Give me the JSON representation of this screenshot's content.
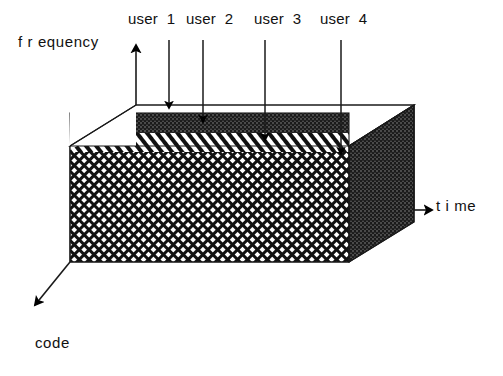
{
  "figure": {
    "background_color": "#ffffff",
    "stroke_color": "#000000"
  },
  "axes": [
    {
      "id": "frequency",
      "label": "f r equency",
      "direction": "up",
      "label_x": 18,
      "label_y": 33
    },
    {
      "id": "time",
      "label": "t i me",
      "direction": "right",
      "label_x": 436,
      "label_y": 197
    },
    {
      "id": "code",
      "label": "code",
      "direction": "down-left",
      "label_x": 35,
      "label_y": 334
    }
  ],
  "callouts": [
    {
      "id": "user-1",
      "label": "user  1",
      "label_x": 128,
      "label_y": 10,
      "arrow_x": 169,
      "arrow_top": 40,
      "arrow_bottom": 108
    },
    {
      "id": "user-2",
      "label": "user  2",
      "label_x": 186,
      "label_y": 10,
      "arrow_x": 203,
      "arrow_top": 40,
      "arrow_bottom": 122
    },
    {
      "id": "user-3",
      "label": "user  3",
      "label_x": 254,
      "label_y": 10,
      "arrow_x": 265,
      "arrow_top": 40,
      "arrow_bottom": 140
    },
    {
      "id": "user-4",
      "label": "user  4",
      "label_x": 320,
      "label_y": 10,
      "arrow_x": 341,
      "arrow_top": 40,
      "arrow_bottom": 154
    }
  ],
  "cube": {
    "front_face_bands": [
      {
        "id": "code-band-dark",
        "pattern": "dense-dark-dots",
        "color": "#3a3a3a"
      },
      {
        "id": "code-band-stripes",
        "pattern": "diagonal-stripes",
        "color": "#000000"
      },
      {
        "id": "code-band-crosshatch",
        "pattern": "crosshatch",
        "color": "#000000"
      }
    ],
    "right_face": {
      "id": "right-face",
      "pattern": "dense-dark-dots",
      "color": "#3a3a3a"
    },
    "top_face": {
      "id": "top-face",
      "pattern": "empty",
      "color": "#ffffff"
    }
  }
}
